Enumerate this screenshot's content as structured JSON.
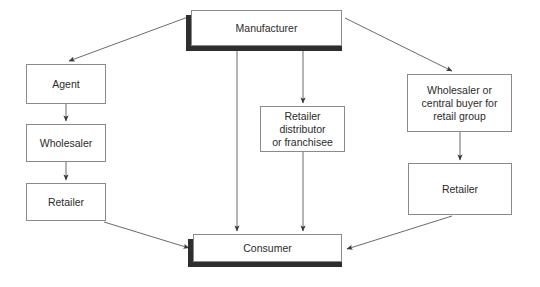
{
  "diagram": {
    "background_color": "#ffffff",
    "box_border_color": "#8a8a8a",
    "shadow_color": "#2e2e2e",
    "connector_color": "#6b6b6b",
    "text_color": "#2b2b2b",
    "nodes": [
      {
        "id": "manufacturer",
        "label": "Manufacturer",
        "x": 191,
        "y": 10,
        "w": 151,
        "h": 36,
        "shadow": true
      },
      {
        "id": "agent",
        "label": "Agent",
        "x": 26,
        "y": 64,
        "w": 80,
        "h": 40,
        "shadow": false
      },
      {
        "id": "wholesaler",
        "label": "Wholesaler",
        "x": 26,
        "y": 124,
        "w": 80,
        "h": 38,
        "shadow": false
      },
      {
        "id": "retailer-left",
        "label": "Retailer",
        "x": 26,
        "y": 183,
        "w": 80,
        "h": 38,
        "shadow": false
      },
      {
        "id": "retailer-distributor",
        "label": "Retailer\ndistributor\nor franchisee",
        "x": 260,
        "y": 106,
        "w": 85,
        "h": 46,
        "shadow": false
      },
      {
        "id": "wholesaler-central-buyer",
        "label": "Wholesaler or\ncentral buyer for\nretail group",
        "x": 407,
        "y": 74,
        "w": 105,
        "h": 58,
        "shadow": false
      },
      {
        "id": "retailer-right",
        "label": "Retailer",
        "x": 408,
        "y": 163,
        "w": 104,
        "h": 52,
        "shadow": false
      },
      {
        "id": "consumer",
        "label": "Consumer",
        "x": 193,
        "y": 234,
        "w": 149,
        "h": 28,
        "shadow": true
      }
    ],
    "edges": [
      {
        "id": "manufacturer-to-agent",
        "from": "manufacturer",
        "to": "agent",
        "kind": "diagonal"
      },
      {
        "id": "manufacturer-to-wholesaler-central-buyer",
        "from": "manufacturer",
        "to": "wholesaler-central-buyer",
        "kind": "diagonal"
      },
      {
        "id": "manufacturer-to-consumer",
        "from": "manufacturer",
        "to": "consumer",
        "kind": "vertical"
      },
      {
        "id": "manufacturer-to-retailer-distributor",
        "from": "manufacturer",
        "to": "retailer-distributor",
        "kind": "vertical"
      },
      {
        "id": "agent-to-wholesaler",
        "from": "agent",
        "to": "wholesaler",
        "kind": "vertical"
      },
      {
        "id": "wholesaler-to-retailer-left",
        "from": "wholesaler",
        "to": "retailer-left",
        "kind": "vertical"
      },
      {
        "id": "retailer-left-to-consumer",
        "from": "retailer-left",
        "to": "consumer",
        "kind": "diagonal"
      },
      {
        "id": "retailer-distributor-to-consumer",
        "from": "retailer-distributor",
        "to": "consumer",
        "kind": "vertical"
      },
      {
        "id": "wholesaler-central-buyer-to-retailer-right",
        "from": "wholesaler-central-buyer",
        "to": "retailer-right",
        "kind": "vertical"
      },
      {
        "id": "retailer-right-to-consumer",
        "from": "retailer-right",
        "to": "consumer",
        "kind": "diagonal"
      }
    ]
  }
}
